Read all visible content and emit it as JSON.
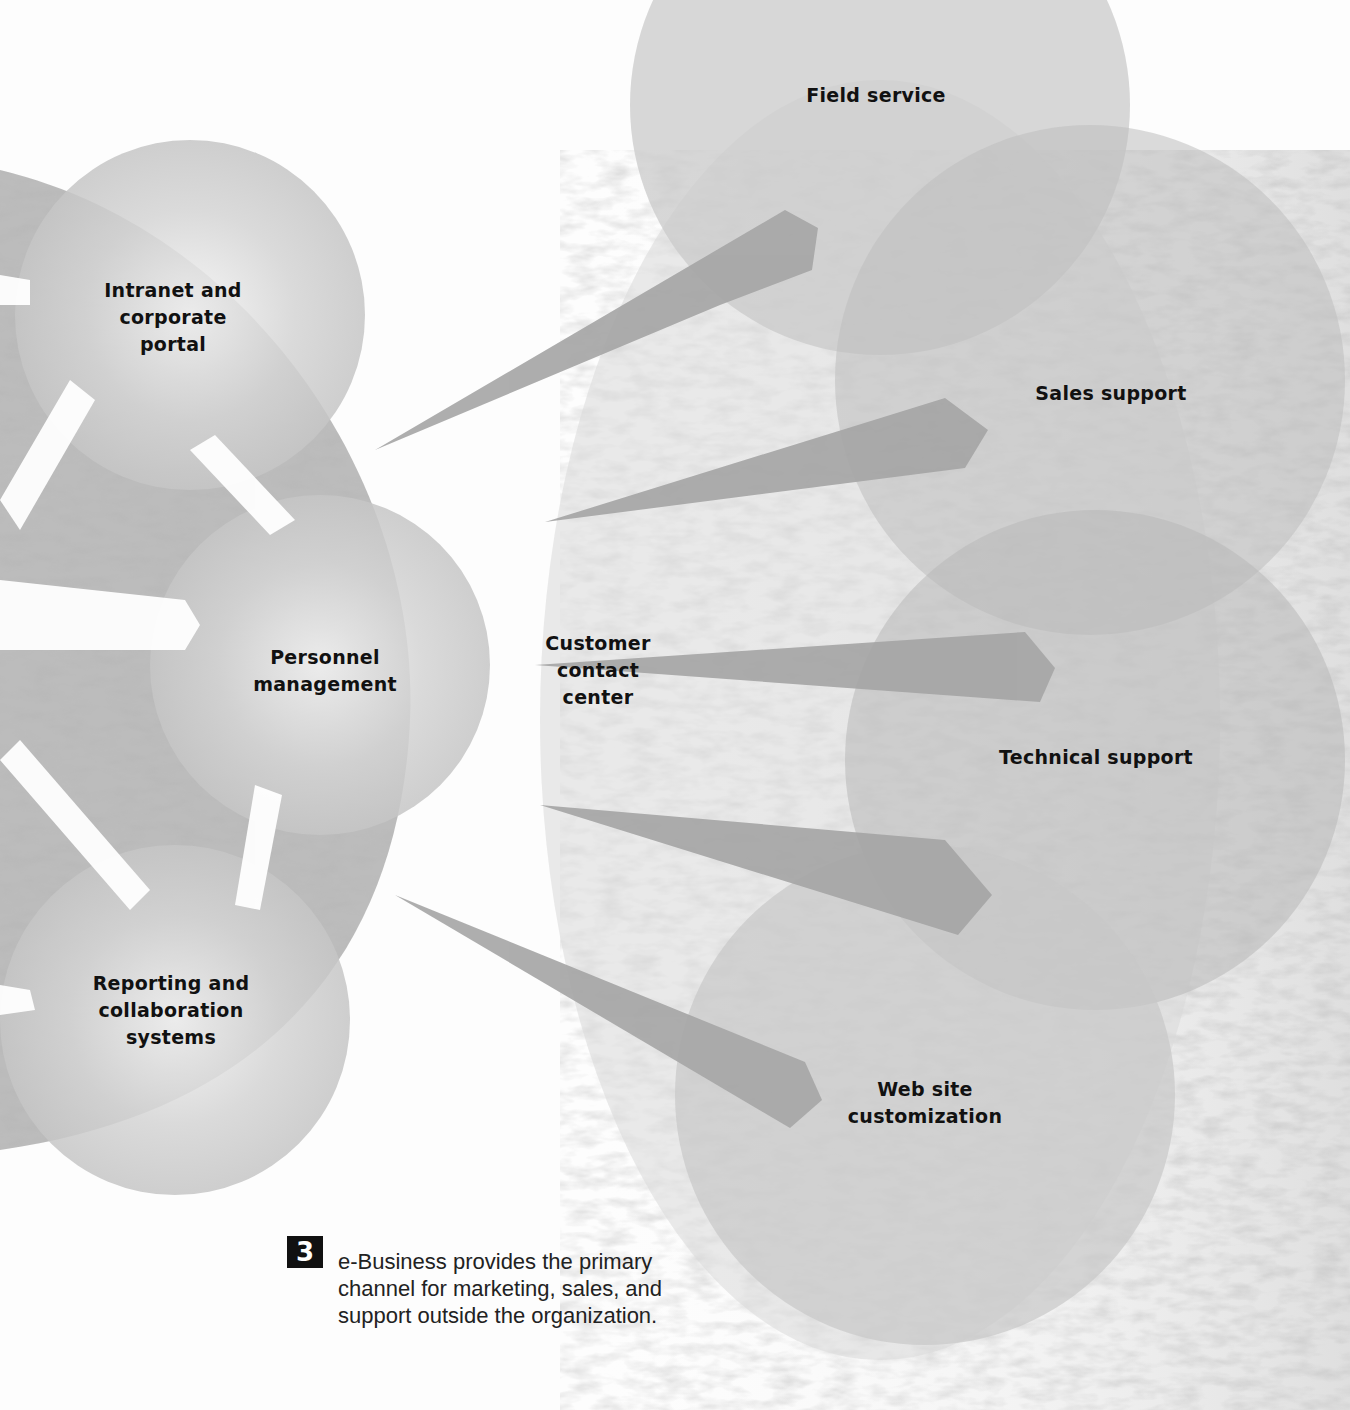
{
  "figure": {
    "number": "3",
    "caption_lines": [
      "e-Business provides the primary",
      "channel for marketing, sales, and",
      "support outside the organization."
    ]
  },
  "internal_nodes": [
    {
      "id": "intranet",
      "lines": [
        "Intranet and",
        "corporate",
        "portal"
      ]
    },
    {
      "id": "personnel",
      "lines": [
        "Personnel",
        "management"
      ]
    },
    {
      "id": "reporting",
      "lines": [
        "Reporting and",
        "collaboration",
        "systems"
      ]
    }
  ],
  "hub": {
    "id": "customer-contact-center",
    "lines": [
      "Customer",
      "contact",
      "center"
    ]
  },
  "external_nodes": [
    {
      "id": "field-service",
      "lines": [
        "Field service"
      ]
    },
    {
      "id": "sales-support",
      "lines": [
        "Sales support"
      ]
    },
    {
      "id": "technical-support",
      "lines": [
        "Technical support"
      ]
    },
    {
      "id": "web-site-customization",
      "lines": [
        "Web site",
        "customization"
      ]
    }
  ],
  "colors": {
    "background": "#fdfdfd",
    "circle_fill": "#c8c8c8",
    "arrow_fill": "#a9a9a9",
    "text": "#111111",
    "fig_num_bg": "#111111"
  }
}
